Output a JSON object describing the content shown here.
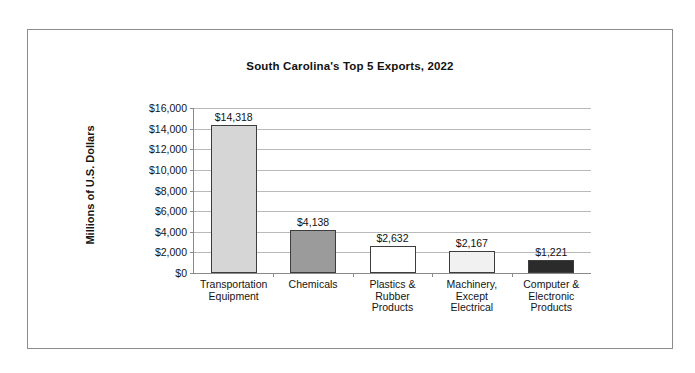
{
  "chart_data": {
    "type": "bar",
    "title": "South Carolina's Top 5 Exports, 2022",
    "xlabel": "",
    "ylabel": "Millions of U.S. Dollars",
    "categories": [
      "Transportation\nEquipment",
      "Chemicals",
      "Plastics &\nRubber\nProducts",
      "Machinery,\nExcept\nElectrical",
      "Computer &\nElectronic\nProducts"
    ],
    "values": [
      14318,
      4138,
      2632,
      2167,
      1221
    ],
    "value_labels": [
      "$14,318",
      "$4,138",
      "$2,632",
      "$2,167",
      "$1,221"
    ],
    "bar_colors": [
      "#d6d6d6",
      "#9b9b9b",
      "#ffffff",
      "#f1f1f1",
      "#2b2b2b"
    ],
    "bar_border_color": "#3d3d3d",
    "ylim": [
      0,
      16000
    ],
    "ytick_values": [
      16000,
      14000,
      12000,
      10000,
      8000,
      6000,
      4000,
      2000,
      0
    ],
    "ytick_labels": [
      "$16,000",
      "$14,000",
      "$12,000",
      "$10,000",
      "$8,000",
      "$6,000",
      "$4,000",
      "$2,000",
      "$0"
    ],
    "grid": true,
    "grid_color": "#b9b9b9",
    "axis_color": "#8a8a8a",
    "legend": "none",
    "frame_color": "#8c8c8c",
    "background": "#ffffff"
  }
}
